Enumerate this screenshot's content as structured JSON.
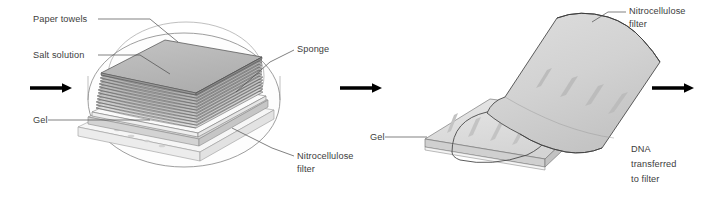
{
  "figure": {
    "background_color": "#ffffff",
    "width": 719,
    "height": 201
  },
  "palette": {
    "label_text": "#3d3d3d",
    "leader_line": "#4a4a4a",
    "arrow": "#000000",
    "dish_outline": "#7e7e7e",
    "towel_top": "#b9b9b9",
    "towel_side": "#9d9d9d",
    "towel_stripe_dark": "#4f4f4f",
    "gel_top": "#e2e2e2",
    "gel_side": "#cfcfcf",
    "filter_face": "#d6d6d6",
    "filter_shadow": "#b4b4b4",
    "band_fill": "#c2c2c2",
    "sponge": "#f2f2f2"
  },
  "panels": [
    {
      "id": "panel-left",
      "name": "blot-assembly-panel",
      "description": "Gel, nitrocellulose filter, paper towel stack and sponge sitting in a dish of salt solution",
      "labels": [
        {
          "id": "paper-towels",
          "text": "Paper towels",
          "x": 33,
          "y": 22,
          "anchor": "start"
        },
        {
          "id": "salt-solution",
          "text": "Salt solution",
          "x": 33,
          "y": 58,
          "anchor": "start"
        },
        {
          "id": "gel",
          "text": "Gel",
          "x": 33,
          "y": 123,
          "anchor": "start"
        },
        {
          "id": "sponge",
          "text": "Sponge",
          "x": 297,
          "y": 52,
          "anchor": "start"
        },
        {
          "id": "nitrocellulose-1",
          "text": "Nitrocellulose",
          "x": 297,
          "y": 159,
          "anchor": "start"
        },
        {
          "id": "nitrocellulose-1b",
          "text": "filter",
          "x": 297,
          "y": 172,
          "anchor": "start"
        }
      ]
    },
    {
      "id": "panel-right",
      "name": "transferred-blot-panel",
      "description": "Nitrocellulose filter peeled back off the gel, DNA bands now on the filter",
      "labels": [
        {
          "id": "nitrocellulose-2",
          "text": "Nitrocellulose",
          "x": 629,
          "y": 14,
          "anchor": "start"
        },
        {
          "id": "nitrocellulose-2b",
          "text": "filter",
          "x": 629,
          "y": 27,
          "anchor": "start"
        },
        {
          "id": "gel-2",
          "text": "Gel",
          "x": 370,
          "y": 140,
          "anchor": "start"
        },
        {
          "id": "dna-transferred-1",
          "text": "DNA",
          "x": 631,
          "y": 152,
          "anchor": "start"
        },
        {
          "id": "dna-transferred-2",
          "text": "transferred",
          "x": 631,
          "y": 167,
          "anchor": "start"
        },
        {
          "id": "dna-transferred-3",
          "text": "to filter",
          "x": 631,
          "y": 182,
          "anchor": "start"
        }
      ]
    }
  ],
  "arrows": [
    {
      "id": "arrow-in",
      "name": "flow-arrow-left",
      "x1": 30,
      "x2": 72,
      "y": 88
    },
    {
      "id": "arrow-middle",
      "name": "flow-arrow-middle",
      "x1": 340,
      "x2": 382,
      "y": 88
    },
    {
      "id": "arrow-out",
      "name": "flow-arrow-right",
      "x1": 652,
      "x2": 694,
      "y": 88
    }
  ],
  "gel_bands": {
    "gel_lane_count": 4,
    "filter_lane_count": 4,
    "note": "Four DNA bands visible in the gel and four matching bands on the filter"
  }
}
